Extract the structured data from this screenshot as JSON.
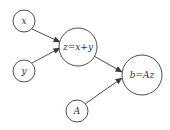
{
  "diagram": {
    "type": "computational-graph",
    "colors": {
      "stroke": "#3a3a3a",
      "text": "#333333",
      "background": "#ffffff"
    },
    "nodes": [
      {
        "id": "x",
        "label": "x",
        "cx": 24,
        "cy": 21,
        "r": 11
      },
      {
        "id": "y",
        "label": "y",
        "cx": 24,
        "cy": 71,
        "r": 11
      },
      {
        "id": "z",
        "label": "z=x+y",
        "cx": 78,
        "cy": 47,
        "r": 19
      },
      {
        "id": "A",
        "label": "A",
        "cx": 77,
        "cy": 111,
        "r": 11
      },
      {
        "id": "b",
        "label": "b=Az",
        "cx": 142,
        "cy": 75,
        "r": 20
      }
    ],
    "edges": [
      {
        "from": "x",
        "to": "z"
      },
      {
        "from": "y",
        "to": "z"
      },
      {
        "from": "z",
        "to": "b"
      },
      {
        "from": "A",
        "to": "b"
      }
    ]
  }
}
